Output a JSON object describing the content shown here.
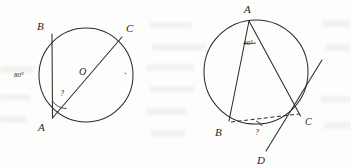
{
  "page": {
    "kind": "geometry-figure-pair",
    "background_color": "#fdfdfc",
    "ink_color": "#2c2c2c"
  },
  "figures": [
    {
      "id": "left",
      "name": "circle-inscribed-angle-diameter",
      "circle": {
        "cx": 86,
        "cy": 75,
        "r": 47
      },
      "points": [
        {
          "key": "B",
          "label": "B",
          "x": 52,
          "y": 34,
          "label_x": 37,
          "label_y": 30
        },
        {
          "key": "C",
          "label": "C",
          "x": 122,
          "y": 37,
          "label_x": 126,
          "label_y": 32
        },
        {
          "key": "A",
          "label": "A",
          "x": 52,
          "y": 118,
          "label_x": 38,
          "label_y": 131
        },
        {
          "key": "O",
          "label": "O",
          "x": 86,
          "y": 75,
          "label_x": 80,
          "label_y": 74
        }
      ],
      "segments": [
        {
          "name": "chord-AB",
          "from": "B",
          "to": "A"
        },
        {
          "name": "diameter-AC",
          "from": "A",
          "to": "C"
        }
      ],
      "annotations": [
        {
          "name": "arc-measure-label",
          "text": "80°",
          "x": 14,
          "y": 75
        },
        {
          "name": "unknown-angle-label",
          "text": "?",
          "x": 61,
          "y": 94
        }
      ]
    },
    {
      "id": "right",
      "name": "circle-tangent-chord-angle",
      "circle": {
        "cx": 256,
        "cy": 72,
        "r": 52
      },
      "points": [
        {
          "key": "A",
          "label": "A",
          "x": 249,
          "y": 20,
          "label_x": 245,
          "label_y": 13
        },
        {
          "key": "B",
          "label": "B",
          "x": 229,
          "y": 121,
          "label_x": 216,
          "label_y": 135
        },
        {
          "key": "C",
          "label": "C",
          "x": 300,
          "y": 116,
          "label_x": 305,
          "label_y": 124
        },
        {
          "key": "D",
          "label": "D",
          "x": 268,
          "y": 152,
          "label_x": 259,
          "label_y": 163
        }
      ],
      "segments": [
        {
          "name": "chord-AB",
          "from": "A",
          "to": "B"
        },
        {
          "name": "chord-AC",
          "from": "A",
          "to": "C"
        },
        {
          "name": "chord-BC-dashed",
          "from": "B",
          "to": "C",
          "style": "dashed"
        },
        {
          "name": "tangent-line-through-C",
          "from": "D",
          "to": "tangent-end"
        }
      ],
      "annotations": [
        {
          "name": "inscribed-angle-label",
          "text": "40°",
          "x": 246,
          "y": 44
        },
        {
          "name": "unknown-angle-label",
          "text": "?",
          "x": 258,
          "y": 133
        }
      ]
    }
  ]
}
